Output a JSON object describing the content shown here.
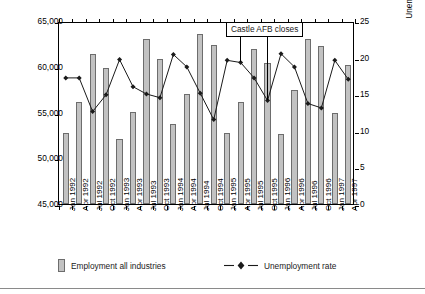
{
  "chart_data": {
    "type": "bar",
    "title": "",
    "xlabel": "",
    "ylabel": "Employment all industries",
    "y2label": "Unemployment rate (%)",
    "ylim": [
      45000,
      65000
    ],
    "y2lim": [
      0,
      25
    ],
    "yticks": [
      "45,000",
      "50,000",
      "55,000",
      "60,000",
      "65,000"
    ],
    "ytick_values": [
      45000,
      50000,
      55000,
      60000,
      65000
    ],
    "y2ticks": [
      "0",
      "5",
      "10",
      "15",
      "20",
      "25"
    ],
    "y2tick_values": [
      0,
      5,
      10,
      15,
      20,
      25
    ],
    "grid": false,
    "legend_position": "bottom",
    "categories": [
      "Jan 1992",
      "Apr 1992",
      "Jul 1992",
      "Oct 1992",
      "Jan 1993",
      "Apr 1993",
      "Jul 1993",
      "Oct 1993",
      "Jan 1994",
      "Apr 1994",
      "Jul 1994",
      "Oct 1994",
      "Jan 1995",
      "Apr 1995",
      "Jul 1995",
      "Oct 1995",
      "Jan 1996",
      "Apr 1996",
      "Jul 1996",
      "Oct 1996",
      "Jan 1997",
      "Apr 1997"
    ],
    "series": [
      {
        "name": "Employment all industries",
        "type": "bar",
        "axis": "left",
        "color": "#c2c2c2",
        "edge_color": "#6d6d6d",
        "values": [
          52800,
          56100,
          61400,
          59900,
          52100,
          55100,
          63000,
          60800,
          53700,
          57000,
          63600,
          62400,
          52800,
          56200,
          61900,
          60400,
          52600,
          57500,
          63000,
          62300,
          54900,
          60200
        ]
      },
      {
        "name": "Unemployment rate",
        "type": "line",
        "axis": "right",
        "color": "#1a1a1a",
        "marker": "diamond",
        "values": [
          17.5,
          17.5,
          12.9,
          15.2,
          20.0,
          16.3,
          15.3,
          14.8,
          20.7,
          19.0,
          15.4,
          11.8,
          19.9,
          19.6,
          17.5,
          14.4,
          20.8,
          19.0,
          14.0,
          13.4,
          19.9,
          17.3
        ]
      }
    ],
    "annotations": [
      {
        "text": "Castle AFB closes",
        "pointers": [
          "Apr 1995",
          "Oct 1995"
        ]
      }
    ],
    "legend": [
      {
        "label": "Employment all industries",
        "marker": "bar-swatch"
      },
      {
        "label": "Unemployment rate",
        "marker": "line-diamond"
      }
    ]
  }
}
